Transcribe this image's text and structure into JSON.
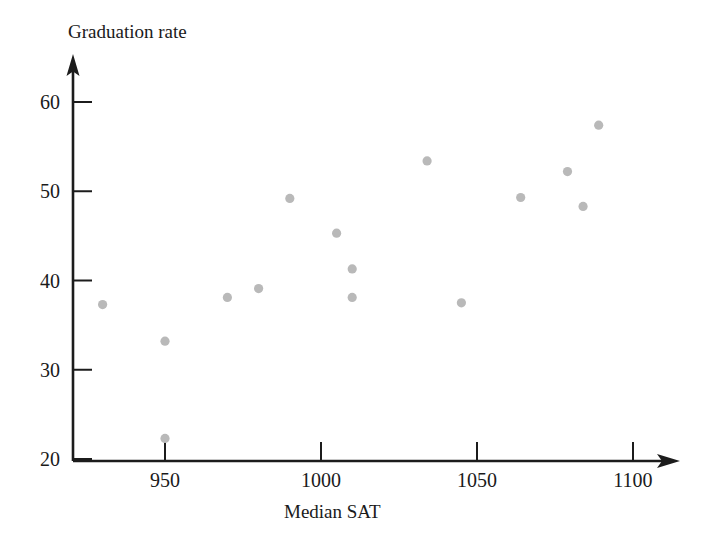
{
  "chart_data": {
    "type": "scatter",
    "title": "",
    "xlabel": "Median SAT",
    "ylabel": "Graduation rate",
    "xlim": [
      925,
      1110
    ],
    "ylim": [
      20,
      64
    ],
    "xticks": [
      950,
      1000,
      1050,
      1100
    ],
    "yticks": [
      20,
      30,
      40,
      50,
      60
    ],
    "xtick_labels": [
      "950",
      "1000",
      "1050",
      "1100"
    ],
    "ytick_labels": [
      "20",
      "30",
      "40",
      "50",
      "60"
    ],
    "grid": false,
    "legend": null,
    "point_color": "#b9b9b9",
    "axis_color": "#1c1c1c",
    "x": [
      930,
      950,
      950,
      970,
      980,
      990,
      1005,
      1010,
      1010,
      1034,
      1045,
      1064,
      1079,
      1084,
      1089
    ],
    "y": [
      37.3,
      33.2,
      22.3,
      38.1,
      39.1,
      49.2,
      45.3,
      41.3,
      38.1,
      53.4,
      37.5,
      49.3,
      52.2,
      48.3,
      57.4
    ],
    "points": [
      {
        "x": 930,
        "y": 37.3
      },
      {
        "x": 950,
        "y": 33.2
      },
      {
        "x": 950,
        "y": 22.3
      },
      {
        "x": 970,
        "y": 38.1
      },
      {
        "x": 980,
        "y": 39.1
      },
      {
        "x": 990,
        "y": 49.2
      },
      {
        "x": 1005,
        "y": 45.3
      },
      {
        "x": 1010,
        "y": 41.3
      },
      {
        "x": 1010,
        "y": 38.1
      },
      {
        "x": 1034,
        "y": 53.4
      },
      {
        "x": 1045,
        "y": 37.5
      },
      {
        "x": 1064,
        "y": 49.3
      },
      {
        "x": 1079,
        "y": 52.2
      },
      {
        "x": 1084,
        "y": 48.3
      },
      {
        "x": 1089,
        "y": 57.4
      }
    ]
  },
  "axes": {
    "y_axis_title": "Graduation rate",
    "x_axis_title": "Median SAT"
  }
}
